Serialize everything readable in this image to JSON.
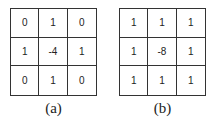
{
  "kernels": [
    {
      "label": "(a)",
      "values": [
        [
          0,
          1,
          0
        ],
        [
          1,
          -4,
          1
        ],
        [
          0,
          1,
          0
        ]
      ]
    },
    {
      "label": "(b)",
      "values": [
        [
          1,
          1,
          1
        ],
        [
          1,
          -8,
          1
        ],
        [
          1,
          1,
          1
        ]
      ]
    }
  ]
}
